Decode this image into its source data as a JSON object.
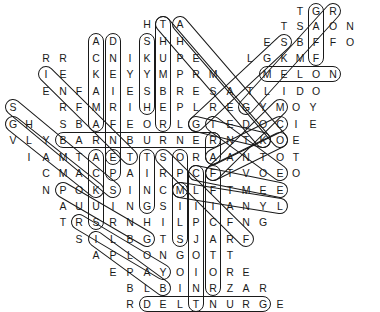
{
  "puzzle": {
    "type": "word-search",
    "letter_color": "#1a1a1a",
    "outline_color": "#1a1a1a",
    "background": "#ffffff"
  },
  "letters": [
    {
      "ch": "T",
      "x": 300,
      "y": 11
    },
    {
      "ch": "G",
      "x": 316,
      "y": 11
    },
    {
      "ch": "R",
      "x": 333,
      "y": 11
    },
    {
      "ch": "H",
      "x": 147,
      "y": 24
    },
    {
      "ch": "T",
      "x": 163,
      "y": 24
    },
    {
      "ch": "A",
      "x": 180,
      "y": 24
    },
    {
      "ch": "T",
      "x": 284,
      "y": 26
    },
    {
      "ch": "S",
      "x": 300,
      "y": 26
    },
    {
      "ch": "A",
      "x": 316,
      "y": 26
    },
    {
      "ch": "O",
      "x": 333,
      "y": 26
    },
    {
      "ch": "N",
      "x": 350,
      "y": 26
    },
    {
      "ch": "A",
      "x": 96,
      "y": 41
    },
    {
      "ch": "D",
      "x": 113,
      "y": 41
    },
    {
      "ch": "S",
      "x": 147,
      "y": 41
    },
    {
      "ch": "H",
      "x": 163,
      "y": 41
    },
    {
      "ch": "H",
      "x": 180,
      "y": 41
    },
    {
      "ch": "E",
      "x": 267,
      "y": 42
    },
    {
      "ch": "S",
      "x": 284,
      "y": 42
    },
    {
      "ch": "B",
      "x": 300,
      "y": 42
    },
    {
      "ch": "F",
      "x": 316,
      "y": 42
    },
    {
      "ch": "F",
      "x": 333,
      "y": 42
    },
    {
      "ch": "O",
      "x": 350,
      "y": 42
    },
    {
      "ch": "R",
      "x": 46,
      "y": 58
    },
    {
      "ch": "R",
      "x": 63,
      "y": 58
    },
    {
      "ch": "C",
      "x": 96,
      "y": 58
    },
    {
      "ch": "N",
      "x": 113,
      "y": 58
    },
    {
      "ch": "I",
      "x": 130,
      "y": 58
    },
    {
      "ch": "K",
      "x": 147,
      "y": 58
    },
    {
      "ch": "U",
      "x": 163,
      "y": 58
    },
    {
      "ch": "P",
      "x": 180,
      "y": 58
    },
    {
      "ch": "E",
      "x": 196,
      "y": 58
    },
    {
      "ch": "L",
      "x": 250,
      "y": 58
    },
    {
      "ch": "G",
      "x": 267,
      "y": 58
    },
    {
      "ch": "K",
      "x": 284,
      "y": 58
    },
    {
      "ch": "M",
      "x": 300,
      "y": 58
    },
    {
      "ch": "F",
      "x": 316,
      "y": 58
    },
    {
      "ch": "I",
      "x": 46,
      "y": 74
    },
    {
      "ch": "E",
      "x": 63,
      "y": 74
    },
    {
      "ch": "K",
      "x": 96,
      "y": 74
    },
    {
      "ch": "E",
      "x": 113,
      "y": 74
    },
    {
      "ch": "Y",
      "x": 130,
      "y": 74
    },
    {
      "ch": "Y",
      "x": 147,
      "y": 74
    },
    {
      "ch": "M",
      "x": 163,
      "y": 74
    },
    {
      "ch": "P",
      "x": 180,
      "y": 74
    },
    {
      "ch": "R",
      "x": 196,
      "y": 74
    },
    {
      "ch": "M",
      "x": 213,
      "y": 74
    },
    {
      "ch": "M",
      "x": 267,
      "y": 74
    },
    {
      "ch": "E",
      "x": 284,
      "y": 74
    },
    {
      "ch": "L",
      "x": 300,
      "y": 74
    },
    {
      "ch": "O",
      "x": 316,
      "y": 74
    },
    {
      "ch": "N",
      "x": 333,
      "y": 74
    },
    {
      "ch": "E",
      "x": 46,
      "y": 91
    },
    {
      "ch": "N",
      "x": 63,
      "y": 91
    },
    {
      "ch": "F",
      "x": 79,
      "y": 91
    },
    {
      "ch": "A",
      "x": 96,
      "y": 91
    },
    {
      "ch": "I",
      "x": 113,
      "y": 91
    },
    {
      "ch": "E",
      "x": 130,
      "y": 91
    },
    {
      "ch": "S",
      "x": 147,
      "y": 91
    },
    {
      "ch": "B",
      "x": 163,
      "y": 91
    },
    {
      "ch": "R",
      "x": 180,
      "y": 91
    },
    {
      "ch": "E",
      "x": 196,
      "y": 91
    },
    {
      "ch": "S",
      "x": 213,
      "y": 91
    },
    {
      "ch": "A",
      "x": 230,
      "y": 91
    },
    {
      "ch": "T",
      "x": 250,
      "y": 91
    },
    {
      "ch": "L",
      "x": 267,
      "y": 91
    },
    {
      "ch": "I",
      "x": 284,
      "y": 91
    },
    {
      "ch": "D",
      "x": 300,
      "y": 91
    },
    {
      "ch": "O",
      "x": 316,
      "y": 91
    },
    {
      "ch": "S",
      "x": 13,
      "y": 107
    },
    {
      "ch": "R",
      "x": 63,
      "y": 107
    },
    {
      "ch": "F",
      "x": 79,
      "y": 107
    },
    {
      "ch": "M",
      "x": 96,
      "y": 107
    },
    {
      "ch": "R",
      "x": 113,
      "y": 107
    },
    {
      "ch": "I",
      "x": 130,
      "y": 107
    },
    {
      "ch": "H",
      "x": 147,
      "y": 107
    },
    {
      "ch": "E",
      "x": 163,
      "y": 107
    },
    {
      "ch": "P",
      "x": 180,
      "y": 107
    },
    {
      "ch": "L",
      "x": 196,
      "y": 107
    },
    {
      "ch": "R",
      "x": 213,
      "y": 107
    },
    {
      "ch": "E",
      "x": 230,
      "y": 107
    },
    {
      "ch": "G",
      "x": 246,
      "y": 107
    },
    {
      "ch": "Y",
      "x": 263,
      "y": 107
    },
    {
      "ch": "M",
      "x": 280,
      "y": 107
    },
    {
      "ch": "O",
      "x": 296,
      "y": 107
    },
    {
      "ch": "Y",
      "x": 313,
      "y": 107
    },
    {
      "ch": "G",
      "x": 13,
      "y": 124
    },
    {
      "ch": "H",
      "x": 29,
      "y": 124
    },
    {
      "ch": "S",
      "x": 63,
      "y": 124
    },
    {
      "ch": "B",
      "x": 79,
      "y": 124
    },
    {
      "ch": "A",
      "x": 96,
      "y": 124
    },
    {
      "ch": "F",
      "x": 113,
      "y": 124
    },
    {
      "ch": "E",
      "x": 130,
      "y": 124
    },
    {
      "ch": "O",
      "x": 147,
      "y": 124
    },
    {
      "ch": "R",
      "x": 163,
      "y": 124
    },
    {
      "ch": "L",
      "x": 180,
      "y": 124
    },
    {
      "ch": "G",
      "x": 196,
      "y": 124
    },
    {
      "ch": "T",
      "x": 213,
      "y": 124
    },
    {
      "ch": "E",
      "x": 230,
      "y": 124
    },
    {
      "ch": "D",
      "x": 246,
      "y": 124
    },
    {
      "ch": "O",
      "x": 263,
      "y": 124
    },
    {
      "ch": "C",
      "x": 280,
      "y": 124
    },
    {
      "ch": "I",
      "x": 296,
      "y": 124
    },
    {
      "ch": "E",
      "x": 313,
      "y": 124
    },
    {
      "ch": "V",
      "x": 13,
      "y": 140
    },
    {
      "ch": "L",
      "x": 29,
      "y": 140
    },
    {
      "ch": "Y",
      "x": 46,
      "y": 140
    },
    {
      "ch": "B",
      "x": 63,
      "y": 140
    },
    {
      "ch": "A",
      "x": 79,
      "y": 140
    },
    {
      "ch": "R",
      "x": 96,
      "y": 140
    },
    {
      "ch": "N",
      "x": 113,
      "y": 140
    },
    {
      "ch": "B",
      "x": 130,
      "y": 140
    },
    {
      "ch": "U",
      "x": 147,
      "y": 140
    },
    {
      "ch": "R",
      "x": 163,
      "y": 140
    },
    {
      "ch": "N",
      "x": 180,
      "y": 140
    },
    {
      "ch": "E",
      "x": 196,
      "y": 140
    },
    {
      "ch": "R",
      "x": 213,
      "y": 140
    },
    {
      "ch": "N",
      "x": 230,
      "y": 140
    },
    {
      "ch": "T",
      "x": 246,
      "y": 140
    },
    {
      "ch": "K",
      "x": 263,
      "y": 140
    },
    {
      "ch": "O",
      "x": 280,
      "y": 140
    },
    {
      "ch": "E",
      "x": 296,
      "y": 140
    },
    {
      "ch": "I",
      "x": 29,
      "y": 157
    },
    {
      "ch": "A",
      "x": 46,
      "y": 157
    },
    {
      "ch": "M",
      "x": 63,
      "y": 157
    },
    {
      "ch": "T",
      "x": 79,
      "y": 157
    },
    {
      "ch": "A",
      "x": 96,
      "y": 157
    },
    {
      "ch": "E",
      "x": 113,
      "y": 157
    },
    {
      "ch": "T",
      "x": 130,
      "y": 157
    },
    {
      "ch": "T",
      "x": 147,
      "y": 157
    },
    {
      "ch": "S",
      "x": 163,
      "y": 157
    },
    {
      "ch": "O",
      "x": 180,
      "y": 157
    },
    {
      "ch": "R",
      "x": 196,
      "y": 157
    },
    {
      "ch": "A",
      "x": 213,
      "y": 157
    },
    {
      "ch": "A",
      "x": 230,
      "y": 157
    },
    {
      "ch": "N",
      "x": 246,
      "y": 157
    },
    {
      "ch": "T",
      "x": 263,
      "y": 157
    },
    {
      "ch": "O",
      "x": 280,
      "y": 157
    },
    {
      "ch": "T",
      "x": 296,
      "y": 157
    },
    {
      "ch": "C",
      "x": 46,
      "y": 173
    },
    {
      "ch": "M",
      "x": 63,
      "y": 173
    },
    {
      "ch": "A",
      "x": 79,
      "y": 173
    },
    {
      "ch": "C",
      "x": 96,
      "y": 173
    },
    {
      "ch": "P",
      "x": 113,
      "y": 173
    },
    {
      "ch": "A",
      "x": 130,
      "y": 173
    },
    {
      "ch": "I",
      "x": 147,
      "y": 173
    },
    {
      "ch": "R",
      "x": 163,
      "y": 173
    },
    {
      "ch": "P",
      "x": 180,
      "y": 173
    },
    {
      "ch": "C",
      "x": 196,
      "y": 173
    },
    {
      "ch": "F",
      "x": 213,
      "y": 173
    },
    {
      "ch": "T",
      "x": 230,
      "y": 173
    },
    {
      "ch": "V",
      "x": 246,
      "y": 173
    },
    {
      "ch": "O",
      "x": 263,
      "y": 173
    },
    {
      "ch": "E",
      "x": 280,
      "y": 173
    },
    {
      "ch": "O",
      "x": 296,
      "y": 173
    },
    {
      "ch": "N",
      "x": 46,
      "y": 190
    },
    {
      "ch": "P",
      "x": 63,
      "y": 190
    },
    {
      "ch": "O",
      "x": 79,
      "y": 190
    },
    {
      "ch": "K",
      "x": 96,
      "y": 190
    },
    {
      "ch": "S",
      "x": 113,
      "y": 190
    },
    {
      "ch": "I",
      "x": 130,
      "y": 190
    },
    {
      "ch": "N",
      "x": 147,
      "y": 190
    },
    {
      "ch": "C",
      "x": 163,
      "y": 190
    },
    {
      "ch": "M",
      "x": 180,
      "y": 190
    },
    {
      "ch": "L",
      "x": 196,
      "y": 190
    },
    {
      "ch": "F",
      "x": 213,
      "y": 190
    },
    {
      "ch": "T",
      "x": 230,
      "y": 190
    },
    {
      "ch": "M",
      "x": 246,
      "y": 190
    },
    {
      "ch": "E",
      "x": 263,
      "y": 190
    },
    {
      "ch": "E",
      "x": 280,
      "y": 190
    },
    {
      "ch": "A",
      "x": 63,
      "y": 206
    },
    {
      "ch": "U",
      "x": 79,
      "y": 206
    },
    {
      "ch": "U",
      "x": 96,
      "y": 206
    },
    {
      "ch": "I",
      "x": 113,
      "y": 206
    },
    {
      "ch": "N",
      "x": 130,
      "y": 206
    },
    {
      "ch": "G",
      "x": 147,
      "y": 206
    },
    {
      "ch": "S",
      "x": 163,
      "y": 206
    },
    {
      "ch": "I",
      "x": 180,
      "y": 206
    },
    {
      "ch": "I",
      "x": 196,
      "y": 206
    },
    {
      "ch": "I",
      "x": 213,
      "y": 206
    },
    {
      "ch": "A",
      "x": 230,
      "y": 206
    },
    {
      "ch": "N",
      "x": 246,
      "y": 206
    },
    {
      "ch": "Y",
      "x": 263,
      "y": 206
    },
    {
      "ch": "L",
      "x": 280,
      "y": 206
    },
    {
      "ch": "T",
      "x": 63,
      "y": 222
    },
    {
      "ch": "R",
      "x": 79,
      "y": 222
    },
    {
      "ch": "S",
      "x": 96,
      "y": 222
    },
    {
      "ch": "R",
      "x": 113,
      "y": 222
    },
    {
      "ch": "N",
      "x": 130,
      "y": 222
    },
    {
      "ch": "H",
      "x": 147,
      "y": 222
    },
    {
      "ch": "I",
      "x": 163,
      "y": 222
    },
    {
      "ch": "L",
      "x": 180,
      "y": 222
    },
    {
      "ch": "P",
      "x": 196,
      "y": 222
    },
    {
      "ch": "C",
      "x": 213,
      "y": 222
    },
    {
      "ch": "F",
      "x": 230,
      "y": 222
    },
    {
      "ch": "N",
      "x": 246,
      "y": 222
    },
    {
      "ch": "G",
      "x": 263,
      "y": 222
    },
    {
      "ch": "S",
      "x": 79,
      "y": 239
    },
    {
      "ch": "I",
      "x": 96,
      "y": 239
    },
    {
      "ch": "L",
      "x": 113,
      "y": 239
    },
    {
      "ch": "B",
      "x": 130,
      "y": 239
    },
    {
      "ch": "G",
      "x": 147,
      "y": 239
    },
    {
      "ch": "T",
      "x": 163,
      "y": 239
    },
    {
      "ch": "S",
      "x": 180,
      "y": 239
    },
    {
      "ch": "J",
      "x": 196,
      "y": 239
    },
    {
      "ch": "A",
      "x": 213,
      "y": 239
    },
    {
      "ch": "R",
      "x": 230,
      "y": 239
    },
    {
      "ch": "F",
      "x": 246,
      "y": 239
    },
    {
      "ch": "A",
      "x": 96,
      "y": 255
    },
    {
      "ch": "P",
      "x": 113,
      "y": 255
    },
    {
      "ch": "L",
      "x": 130,
      "y": 255
    },
    {
      "ch": "O",
      "x": 147,
      "y": 255
    },
    {
      "ch": "N",
      "x": 163,
      "y": 255
    },
    {
      "ch": "G",
      "x": 180,
      "y": 255
    },
    {
      "ch": "O",
      "x": 196,
      "y": 255
    },
    {
      "ch": "T",
      "x": 213,
      "y": 255
    },
    {
      "ch": "T",
      "x": 230,
      "y": 255
    },
    {
      "ch": "E",
      "x": 113,
      "y": 272
    },
    {
      "ch": "P",
      "x": 130,
      "y": 272
    },
    {
      "ch": "A",
      "x": 147,
      "y": 272
    },
    {
      "ch": "Y",
      "x": 163,
      "y": 272
    },
    {
      "ch": "O",
      "x": 180,
      "y": 272
    },
    {
      "ch": "I",
      "x": 196,
      "y": 272
    },
    {
      "ch": "O",
      "x": 213,
      "y": 272
    },
    {
      "ch": "R",
      "x": 230,
      "y": 272
    },
    {
      "ch": "E",
      "x": 246,
      "y": 272
    },
    {
      "ch": "B",
      "x": 130,
      "y": 288
    },
    {
      "ch": "L",
      "x": 147,
      "y": 288
    },
    {
      "ch": "B",
      "x": 163,
      "y": 288
    },
    {
      "ch": "I",
      "x": 180,
      "y": 288
    },
    {
      "ch": "N",
      "x": 196,
      "y": 288
    },
    {
      "ch": "R",
      "x": 213,
      "y": 288
    },
    {
      "ch": "Z",
      "x": 230,
      "y": 288
    },
    {
      "ch": "A",
      "x": 246,
      "y": 288
    },
    {
      "ch": "R",
      "x": 263,
      "y": 288
    },
    {
      "ch": "R",
      "x": 130,
      "y": 304
    },
    {
      "ch": "D",
      "x": 147,
      "y": 304
    },
    {
      "ch": "E",
      "x": 163,
      "y": 304
    },
    {
      "ch": "L",
      "x": 180,
      "y": 304
    },
    {
      "ch": "T",
      "x": 196,
      "y": 304
    },
    {
      "ch": "N",
      "x": 213,
      "y": 304
    },
    {
      "ch": "U",
      "x": 230,
      "y": 304
    },
    {
      "ch": "R",
      "x": 246,
      "y": 304
    },
    {
      "ch": "G",
      "x": 263,
      "y": 304
    },
    {
      "ch": "E",
      "x": 280,
      "y": 304
    }
  ],
  "found_words": [
    {
      "word": "MELON",
      "x1": 267,
      "y1": 74,
      "x2": 333,
      "y2": 74
    },
    {
      "word": "BARNBURNER",
      "x1": 63,
      "y1": 140,
      "x2": 213,
      "y2": 140
    },
    {
      "word": "DELTNURG",
      "x1": 147,
      "y1": 304,
      "x2": 263,
      "y2": 304
    },
    {
      "word": "GAFF",
      "x1": 316,
      "y1": 11,
      "x2": 316,
      "y2": 58
    },
    {
      "word": "ACKAMA",
      "x1": 96,
      "y1": 41,
      "x2": 96,
      "y2": 124
    },
    {
      "word": "DNEIRFE",
      "x1": 113,
      "y1": 41,
      "x2": 113,
      "y2": 157
    },
    {
      "word": "SKYSH",
      "x1": 147,
      "y1": 41,
      "x2": 147,
      "y2": 107
    },
    {
      "word": "THUMBER",
      "x1": 163,
      "y1": 24,
      "x2": 163,
      "y2": 124
    },
    {
      "word": "TEPA",
      "x1": 113,
      "y1": 157,
      "x2": 113,
      "y2": 173
    },
    {
      "word": "TING",
      "x1": 147,
      "y1": 157,
      "x2": 147,
      "y2": 206
    },
    {
      "word": "RIATA",
      "x1": 213,
      "y1": 140,
      "x2": 213,
      "y2": 157
    },
    {
      "word": "MILS",
      "x1": 180,
      "y1": 190,
      "x2": 180,
      "y2": 239
    },
    {
      "word": "CFIPJOIN",
      "x1": 196,
      "y1": 173,
      "x2": 196,
      "y2": 304
    },
    {
      "word": "CFCATOR",
      "x1": 213,
      "y1": 173,
      "x2": 213,
      "y2": 288
    },
    {
      "word": "AUS",
      "x1": 96,
      "y1": 157,
      "x2": 96,
      "y2": 222
    },
    {
      "word": "SILPJ",
      "x1": 180,
      "y1": 157,
      "x2": 180,
      "y2": 190
    },
    {
      "word": "IENAMTE",
      "x1": 46,
      "y1": 74,
      "x2": 130,
      "y2": 157
    },
    {
      "word": "SHAMCP",
      "x1": 13,
      "y1": 107,
      "x2": 113,
      "y2": 190
    },
    {
      "word": "GLAC",
      "x1": 13,
      "y1": 124,
      "x2": 96,
      "y2": 190
    },
    {
      "word": "PORSNG",
      "x1": 63,
      "y1": 190,
      "x2": 147,
      "y2": 239
    },
    {
      "word": "RSLGAY",
      "x1": 79,
      "y1": 222,
      "x2": 163,
      "y2": 272
    },
    {
      "word": "ILPB",
      "x1": 96,
      "y1": 239,
      "x2": 163,
      "y2": 288
    },
    {
      "word": "THPRMAE",
      "x1": 163,
      "y1": 24,
      "x2": 263,
      "y2": 140
    },
    {
      "word": "AHERSRMT",
      "x1": 180,
      "y1": 24,
      "x2": 280,
      "y2": 140
    },
    {
      "word": "GTEK",
      "x1": 196,
      "y1": 124,
      "x2": 263,
      "y2": 140
    },
    {
      "word": "SCCFR",
      "x1": 163,
      "y1": 157,
      "x2": 246,
      "y2": 239
    },
    {
      "word": "CFE",
      "x1": 196,
      "y1": 173,
      "x2": 280,
      "y2": 190
    },
    {
      "word": "TNE",
      "x1": 213,
      "y1": 124,
      "x2": 280,
      "y2": 173
    },
    {
      "word": "MCAN",
      "x1": 180,
      "y1": 190,
      "x2": 280,
      "y2": 206
    },
    {
      "word": "SBKM",
      "x1": 284,
      "y1": 42,
      "x2": 196,
      "y2": 124
    },
    {
      "word": "RAFM",
      "x1": 333,
      "y1": 11,
      "x2": 246,
      "y2": 107
    },
    {
      "word": "MOIEC",
      "x1": 280,
      "y1": 107,
      "x2": 213,
      "y2": 173
    },
    {
      "word": "CKNE",
      "x1": 280,
      "y1": 124,
      "x2": 213,
      "y2": 157
    },
    {
      "word": "OKTR",
      "x1": 280,
      "y1": 140,
      "x2": 213,
      "y2": 173
    }
  ]
}
